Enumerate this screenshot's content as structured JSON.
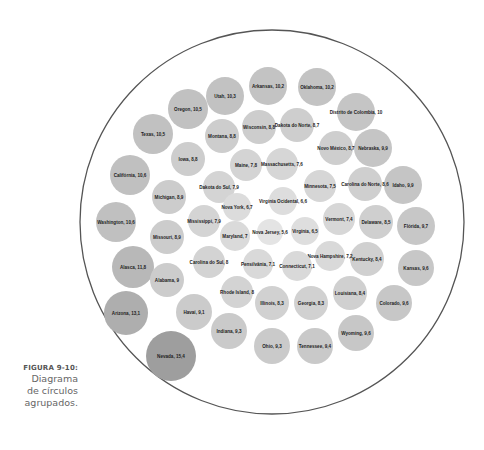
{
  "caption": {
    "figure_label": "FIGURA 9-10:",
    "line1": "Diagrama",
    "line2": "de círculos",
    "line3": "agrupados."
  },
  "colors": {
    "outer_stroke": "#555555",
    "bubble_light": "#e0e0e0",
    "bubble_mid": "#cfcfcf",
    "bubble_dark": "#b0b0b0",
    "text": "#222222"
  },
  "chart_data": {
    "type": "packed-bubble",
    "title": "",
    "outer_circle": {
      "cx": 272,
      "cy": 222,
      "r": 192
    },
    "items": [
      {
        "label": "Nevada",
        "value": 15.4,
        "x": 171,
        "y": 356,
        "r": 25
      },
      {
        "label": "Arizona",
        "value": 13.1,
        "x": 126,
        "y": 313,
        "r": 22
      },
      {
        "label": "Alasca",
        "value": 11.8,
        "x": 133,
        "y": 267,
        "r": 21
      },
      {
        "label": "Washington",
        "value": 10.6,
        "x": 116,
        "y": 222,
        "r": 20
      },
      {
        "label": "Califórnia",
        "value": 10.6,
        "x": 130,
        "y": 175,
        "r": 20
      },
      {
        "label": "Texas",
        "value": 10.5,
        "x": 153,
        "y": 134,
        "r": 20
      },
      {
        "label": "Oregon",
        "value": 10.5,
        "x": 188,
        "y": 109,
        "r": 20
      },
      {
        "label": "Utah",
        "value": 10.3,
        "x": 225,
        "y": 96,
        "r": 19
      },
      {
        "label": "Arkansas",
        "value": 10.2,
        "x": 268,
        "y": 86,
        "r": 19
      },
      {
        "label": "Oklahoma",
        "value": 10.2,
        "x": 317,
        "y": 87,
        "r": 19
      },
      {
        "label": "Distrito de Colombia",
        "value": 10,
        "x": 356,
        "y": 112,
        "r": 19
      },
      {
        "label": "Nebraska",
        "value": 9.9,
        "x": 373,
        "y": 148,
        "r": 19
      },
      {
        "label": "Idaho",
        "value": 9.9,
        "x": 403,
        "y": 185,
        "r": 19
      },
      {
        "label": "Flórida",
        "value": 9.7,
        "x": 416,
        "y": 226,
        "r": 19
      },
      {
        "label": "Kansas",
        "value": 9.6,
        "x": 416,
        "y": 268,
        "r": 18
      },
      {
        "label": "Colorado",
        "value": 9.6,
        "x": 394,
        "y": 303,
        "r": 18
      },
      {
        "label": "Wyoming",
        "value": 9.6,
        "x": 356,
        "y": 333,
        "r": 18
      },
      {
        "label": "Tennessee",
        "value": 9.4,
        "x": 315,
        "y": 346,
        "r": 18
      },
      {
        "label": "Ohio",
        "value": 9.3,
        "x": 272,
        "y": 346,
        "r": 18
      },
      {
        "label": "Indiana",
        "value": 9.3,
        "x": 229,
        "y": 331,
        "r": 18
      },
      {
        "label": "Havaí",
        "value": 9.1,
        "x": 194,
        "y": 312,
        "r": 18
      },
      {
        "label": "Alabama",
        "value": 9,
        "x": 167,
        "y": 280,
        "r": 17
      },
      {
        "label": "Missouri",
        "value": 8.9,
        "x": 167,
        "y": 237,
        "r": 17
      },
      {
        "label": "Michigan",
        "value": 8.9,
        "x": 169,
        "y": 197,
        "r": 17
      },
      {
        "label": "Iowa",
        "value": 8.8,
        "x": 188,
        "y": 159,
        "r": 17
      },
      {
        "label": "Montana",
        "value": 8.8,
        "x": 222,
        "y": 136,
        "r": 17
      },
      {
        "label": "Wisconsin",
        "value": 8.8,
        "x": 259,
        "y": 127,
        "r": 17
      },
      {
        "label": "Dakota do Norte",
        "value": 8.7,
        "x": 297,
        "y": 125,
        "r": 17
      },
      {
        "label": "Novo México",
        "value": 8.7,
        "x": 336,
        "y": 148,
        "r": 17
      },
      {
        "label": "Carolina do Norte",
        "value": 8.6,
        "x": 365,
        "y": 184,
        "r": 17
      },
      {
        "label": "Delaware",
        "value": 8.5,
        "x": 376,
        "y": 222,
        "r": 17
      },
      {
        "label": "Kentucky",
        "value": 8.4,
        "x": 367,
        "y": 259,
        "r": 17
      },
      {
        "label": "Louisiana",
        "value": 8.4,
        "x": 350,
        "y": 293,
        "r": 17
      },
      {
        "label": "Georgia",
        "value": 8.3,
        "x": 311,
        "y": 303,
        "r": 17
      },
      {
        "label": "Illinois",
        "value": 8.3,
        "x": 272,
        "y": 303,
        "r": 17
      },
      {
        "label": "Rhode Island",
        "value": 8,
        "x": 237,
        "y": 292,
        "r": 16
      },
      {
        "label": "Carolina do Sul",
        "value": 8,
        "x": 209,
        "y": 262,
        "r": 16
      },
      {
        "label": "Mississippi",
        "value": 7.9,
        "x": 204,
        "y": 221,
        "r": 16
      },
      {
        "label": "Dakota do Sul",
        "value": 7.9,
        "x": 219,
        "y": 187,
        "r": 16
      },
      {
        "label": "Maine",
        "value": 7.8,
        "x": 246,
        "y": 165,
        "r": 16
      },
      {
        "label": "Massachusetts",
        "value": 7.6,
        "x": 282,
        "y": 164,
        "r": 16
      },
      {
        "label": "Minnesota",
        "value": 7.5,
        "x": 320,
        "y": 186,
        "r": 16
      },
      {
        "label": "Vermont",
        "value": 7.4,
        "x": 339,
        "y": 219,
        "r": 16
      },
      {
        "label": "Nova Hampshire",
        "value": 7.2,
        "x": 330,
        "y": 256,
        "r": 15
      },
      {
        "label": "Connecticut",
        "value": 7.1,
        "x": 297,
        "y": 266,
        "r": 15
      },
      {
        "label": "Pensilvânia",
        "value": 7.1,
        "x": 258,
        "y": 264,
        "r": 15
      },
      {
        "label": "Maryland",
        "value": 7,
        "x": 235,
        "y": 236,
        "r": 15
      },
      {
        "label": "Nova York",
        "value": 6.7,
        "x": 237,
        "y": 207,
        "r": 14
      },
      {
        "label": "Virginia Ocidental",
        "value": 6.6,
        "x": 283,
        "y": 201,
        "r": 14
      },
      {
        "label": "Nova Jersey",
        "value": 5.6,
        "x": 270,
        "y": 232,
        "r": 13
      },
      {
        "label": "Virgínia",
        "value": 6.5,
        "x": 305,
        "y": 231,
        "r": 14
      }
    ]
  }
}
